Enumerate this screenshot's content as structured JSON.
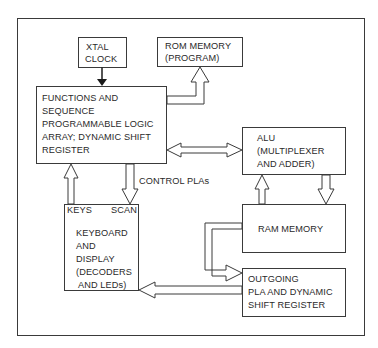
{
  "diagram": {
    "type": "block-diagram",
    "blocks": {
      "xtal": {
        "lines": [
          "XTAL",
          "CLOCK"
        ]
      },
      "rom": {
        "lines": [
          "ROM MEMORY",
          "(PROGRAM)"
        ]
      },
      "functions": {
        "lines": [
          "FUNCTIONS AND",
          "SEQUENCE",
          "PROGRAMMABLE LOGIC",
          "ARRAY; DYNAMIC SHIFT",
          "REGISTER"
        ]
      },
      "alu": {
        "lines": [
          "ALU",
          "(MULTIPLEXER",
          "AND ADDER)"
        ]
      },
      "keyboard": {
        "ports": {
          "left": "KEYS",
          "right": "SCAN"
        },
        "lines": [
          "KEYBOARD",
          "AND",
          "DISPLAY",
          "(DECODERS",
          "AND LEDs)"
        ]
      },
      "ram": {
        "lines": [
          "RAM MEMORY"
        ]
      },
      "outgoing": {
        "lines": [
          "OUTGOING",
          "PLA AND DYNAMIC",
          "SHIFT REGISTER"
        ]
      }
    },
    "labels": {
      "control": "CONTROL PLAs"
    },
    "connections": [
      {
        "from": "xtal",
        "to": "functions",
        "style": "solid-arrow"
      },
      {
        "from": "functions",
        "to": "rom",
        "style": "hollow-arrow"
      },
      {
        "from": "functions",
        "to": "alu",
        "style": "hollow-double-arrow"
      },
      {
        "from": "functions",
        "to": "keyboard",
        "style": "hollow-arrow",
        "label": "CONTROL PLAs"
      },
      {
        "from": "keyboard",
        "to": "functions",
        "style": "hollow-arrow"
      },
      {
        "from": "ram",
        "to": "alu",
        "style": "hollow-arrow"
      },
      {
        "from": "alu",
        "to": "ram",
        "style": "hollow-arrow"
      },
      {
        "from": "ram",
        "to": "outgoing",
        "style": "hollow-arrow"
      },
      {
        "from": "outgoing",
        "to": "keyboard",
        "style": "hollow-arrow"
      }
    ]
  }
}
